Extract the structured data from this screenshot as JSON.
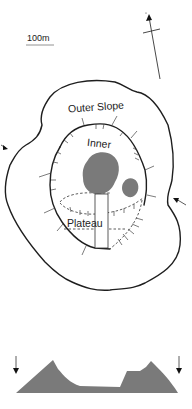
{
  "map": {
    "scale_bar_label": "100m",
    "north_arrow": "north-arrow-icon",
    "labels": {
      "outer_slope": "Outer Slope",
      "inner": "Inner",
      "plateau": "Plateau"
    },
    "colors": {
      "outline": "#1e1e1e",
      "fill_gray": "#7a7a7a",
      "background": "#ffffff"
    },
    "section_markers": [
      "arrow-left-marker",
      "arrow-right-marker"
    ]
  },
  "profile": {
    "description": "cross-section profile",
    "end_markers": [
      "down-arrow-left",
      "down-arrow-right"
    ]
  }
}
